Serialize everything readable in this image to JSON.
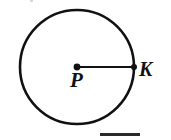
{
  "figure": {
    "type": "geometry-diagram",
    "background_color": "#ffffff",
    "stroke_color": "#111111",
    "canvas": {
      "width": 171,
      "height": 140
    },
    "circle": {
      "name": "circle-P",
      "center_x": 77,
      "center_y": 67,
      "radius": 57,
      "stroke_width": 2.6,
      "fill": "none"
    },
    "center_point": {
      "label": "P",
      "x": 77,
      "y": 67,
      "dot_radius": 3.4
    },
    "radius_segment": {
      "name": "segment-PK",
      "x1": 77,
      "y1": 67,
      "x2": 134,
      "y2": 67,
      "stroke_width": 2.2
    },
    "edge_point": {
      "label": "K",
      "x": 134,
      "y": 67,
      "dot_radius": 3.0
    },
    "labels": {
      "center": "P",
      "edge": "K"
    },
    "bottom_rule": {
      "name": "answer-rule",
      "x": 100,
      "y": 133,
      "width": 40,
      "height": 3,
      "color": "#2a2a2a"
    }
  }
}
